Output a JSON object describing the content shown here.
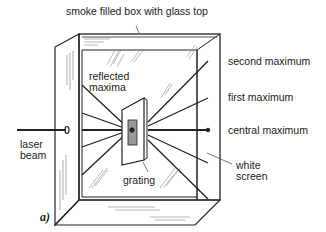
{
  "figure": {
    "panel_label": "a)",
    "labels": {
      "box": "smoke filled box with glass top",
      "reflected": "reflected\nmaxima",
      "second": "second maximum",
      "first": "first maximum",
      "central": "central maximum",
      "laser": "laser\nbeam",
      "grating": "grating",
      "screen": "white\nscreen"
    },
    "colors": {
      "line": "#222222",
      "background": "#ffffff",
      "glass_hatch": "#888888"
    }
  }
}
